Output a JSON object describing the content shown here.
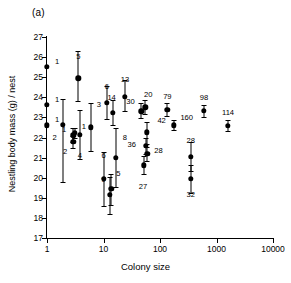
{
  "figure": {
    "panel_label": "(a)",
    "xlabel": "Colony size",
    "ylabel": "Nestling body mass (g) / nest"
  },
  "chart_data": {
    "type": "scatter",
    "title": "(a)",
    "xlabel": "Colony size",
    "ylabel": "Nestling body mass (g) / nest",
    "xscale": "log",
    "xlim": [
      1,
      10000
    ],
    "ylim": [
      17,
      27
    ],
    "grid": false,
    "legend": null,
    "xticks": [
      1,
      10,
      100,
      1000,
      10000
    ],
    "xtick_labels": [
      "1",
      "10",
      "100",
      "1000",
      "10000"
    ],
    "yticks": [
      17,
      18,
      19,
      20,
      21,
      22,
      23,
      24,
      25,
      26,
      27
    ],
    "ytick_labels": [
      "17",
      "18",
      "19",
      "20",
      "21",
      "22",
      "23",
      "24",
      "25",
      "26",
      "27"
    ],
    "marker": "filled-circle",
    "error_bars": "vertical",
    "point_annotation": "sample size (n nests)",
    "points": [
      {
        "x": 1,
        "y": 25.52,
        "lo": 25.52,
        "hi": 25.52,
        "n": "1",
        "lx": 10,
        "ly": -5
      },
      {
        "x": 1,
        "y": 23.62,
        "lo": 23.62,
        "hi": 23.62,
        "n": "1",
        "lx": 10,
        "ly": -5
      },
      {
        "x": 1,
        "y": 22.6,
        "lo": 22.6,
        "hi": 22.6,
        "n": "1",
        "lx": 10,
        "ly": -5
      },
      {
        "x": 1.9,
        "y": 22.62,
        "lo": 19.8,
        "hi": 23.92,
        "n": "2",
        "lx": -8,
        "ly": 13
      },
      {
        "x": 2.9,
        "y": 22.1,
        "lo": 21.78,
        "hi": 22.45,
        "n": "1",
        "lx": -9,
        "ly": -5
      },
      {
        "x": 2.9,
        "y": 21.78,
        "lo": 21.5,
        "hi": 22.05,
        "n": "2",
        "lx": -8,
        "ly": 10
      },
      {
        "x": 3.6,
        "y": 24.95,
        "lo": 23.82,
        "hi": 26.3,
        "n": "5",
        "lx": 0,
        "ly": -21
      },
      {
        "x": 3.8,
        "y": 22.12,
        "lo": 20.95,
        "hi": 23.38,
        "n": "4",
        "lx": 0,
        "ly": 21
      },
      {
        "x": 3.1,
        "y": 22.22,
        "lo": 22.0,
        "hi": 22.45,
        "n": "1",
        "lx": 9,
        "ly": -6
      },
      {
        "x": 6.0,
        "y": 22.5,
        "lo": 21.35,
        "hi": 23.7,
        "n": "3",
        "lx": 8,
        "ly": -22
      },
      {
        "x": 10.0,
        "y": 19.95,
        "lo": 18.58,
        "hi": 21.3,
        "n": "6",
        "lx": 0,
        "ly": -23
      },
      {
        "x": 11.5,
        "y": 23.72,
        "lo": 22.9,
        "hi": 24.55,
        "n": "6",
        "lx": 0,
        "ly": -16
      },
      {
        "x": 12.8,
        "y": 19.15,
        "lo": 18.2,
        "hi": 20.05,
        "n": "9",
        "lx": -6,
        "ly": -15
      },
      {
        "x": 13.8,
        "y": 19.45,
        "lo": 18.62,
        "hi": 20.18,
        "n": "5",
        "lx": 7,
        "ly": -15
      },
      {
        "x": 14.5,
        "y": 23.22,
        "lo": 22.62,
        "hi": 23.88,
        "n": "14",
        "lx": -1,
        "ly": -15
      },
      {
        "x": 16.5,
        "y": 21.0,
        "lo": 19.55,
        "hi": 22.45,
        "n": "8",
        "lx": 9,
        "ly": -20
      },
      {
        "x": 24.0,
        "y": 24.02,
        "lo": 23.3,
        "hi": 24.88,
        "n": "13",
        "lx": 0,
        "ly": -17
      },
      {
        "x": 47.0,
        "y": 23.3,
        "lo": 22.98,
        "hi": 23.7,
        "n": "30",
        "lx": -11,
        "ly": -9
      },
      {
        "x": 55.0,
        "y": 23.5,
        "lo": 23.18,
        "hi": 23.85,
        "n": "20",
        "lx": 3,
        "ly": -12
      },
      {
        "x": 52.0,
        "y": 20.62,
        "lo": 20.18,
        "hi": 21.08,
        "n": "27",
        "lx": -1,
        "ly": 22
      },
      {
        "x": 56.0,
        "y": 21.6,
        "lo": 21.2,
        "hi": 22.0,
        "n": "36",
        "lx": -14,
        "ly": -1
      },
      {
        "x": 58.0,
        "y": 22.25,
        "lo": 21.7,
        "hi": 22.78,
        "n": "42",
        "lx": 15,
        "ly": -11
      },
      {
        "x": 60.0,
        "y": 21.2,
        "lo": 20.85,
        "hi": 21.55,
        "n": "28",
        "lx": 11,
        "ly": -3
      },
      {
        "x": 135,
        "y": 23.38,
        "lo": 23.05,
        "hi": 23.72,
        "n": "79",
        "lx": 0,
        "ly": -13
      },
      {
        "x": 175,
        "y": 22.6,
        "lo": 22.38,
        "hi": 22.85,
        "n": "160",
        "lx": 13,
        "ly": -7
      },
      {
        "x": 350,
        "y": 21.05,
        "lo": 20.32,
        "hi": 21.78,
        "n": "28",
        "lx": 0,
        "ly": -16
      },
      {
        "x": 350,
        "y": 19.95,
        "lo": 19.22,
        "hi": 20.62,
        "n": "32",
        "lx": 0,
        "ly": 16
      },
      {
        "x": 600,
        "y": 23.32,
        "lo": 23.02,
        "hi": 23.62,
        "n": "98",
        "lx": 0,
        "ly": -13
      },
      {
        "x": 1600,
        "y": 22.58,
        "lo": 22.3,
        "hi": 22.88,
        "n": "114",
        "lx": 0,
        "ly": -13
      }
    ]
  }
}
